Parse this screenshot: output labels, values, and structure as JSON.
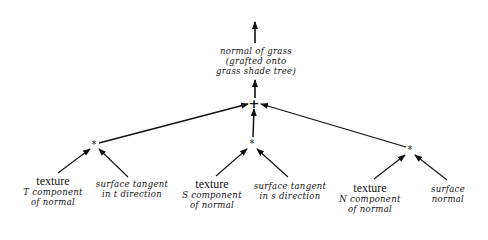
{
  "diagram": {
    "type": "shade-tree",
    "colors": {
      "ink": "#111111",
      "background": "#ffffff"
    },
    "root": {
      "lines": [
        "normal of grass",
        "(grafted onto",
        "grass shade tree)"
      ]
    },
    "sum_node": {
      "symbol": "+"
    },
    "products": [
      {
        "symbol": "*",
        "left": {
          "title": "texture",
          "lines": [
            "T component",
            "of normal"
          ]
        },
        "right": {
          "lines": [
            "surface tangent",
            "in t direction"
          ]
        }
      },
      {
        "symbol": "*",
        "left": {
          "title": "texture",
          "lines": [
            "S component",
            "of normal"
          ]
        },
        "right": {
          "lines": [
            "surface tangent",
            "in s direction"
          ]
        }
      },
      {
        "symbol": "*",
        "left": {
          "title": "texture",
          "lines": [
            "N component",
            "of normal"
          ]
        },
        "right": {
          "lines": [
            "surface",
            "normal"
          ]
        }
      }
    ]
  }
}
